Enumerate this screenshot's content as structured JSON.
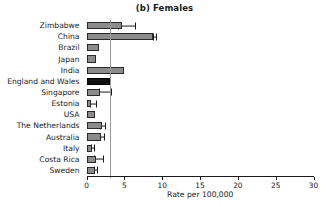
{
  "chart_data": {
    "type": "bar",
    "orientation": "horizontal",
    "title": "(b) Females",
    "xlabel": "Rate per 100,000",
    "ylabel": "",
    "xlim": [
      0,
      30
    ],
    "xticks": [
      0,
      5,
      10,
      15,
      20,
      25,
      30
    ],
    "xtick_labels": [
      "0",
      "5",
      "10",
      "15",
      "20",
      "25",
      "30"
    ],
    "grid": false,
    "legend": false,
    "reference_line": {
      "value": 3.1,
      "label": "England and Wales reference",
      "color": "#9a9a9a"
    },
    "bar_color": "#8c8c8c",
    "highlight_color": "#111111",
    "highlight_category": "England and Wales",
    "categories": [
      "Zimbabwe",
      "China",
      "Brazil",
      "Japan",
      "India",
      "England and Wales",
      "Singapore",
      "Estonia",
      "USA",
      "The Netherlands",
      "Australia",
      "Italy",
      "Costa Rica",
      "Sweden"
    ],
    "values": [
      4.7,
      8.8,
      1.7,
      1.2,
      5.0,
      3.1,
      1.8,
      0.6,
      1.1,
      2.0,
      1.9,
      0.7,
      1.2,
      1.1
    ],
    "error_low": [
      4.2,
      8.8,
      1.7,
      1.2,
      5.0,
      3.1,
      1.6,
      0.5,
      1.1,
      1.8,
      1.8,
      0.6,
      1.0,
      1.0
    ],
    "error_high": [
      6.4,
      9.2,
      1.7,
      1.2,
      5.0,
      3.1,
      3.3,
      1.2,
      1.1,
      2.4,
      2.3,
      1.0,
      2.2,
      1.4
    ]
  }
}
